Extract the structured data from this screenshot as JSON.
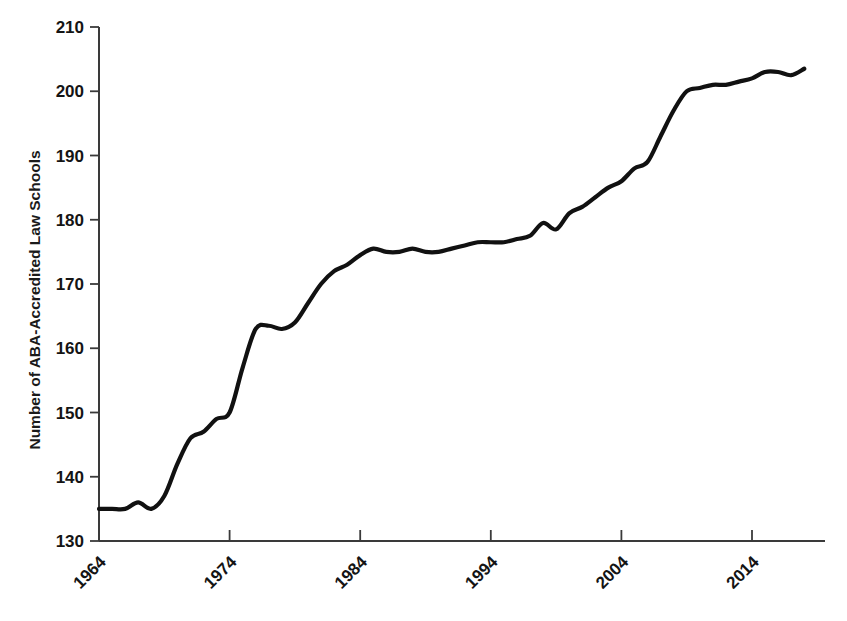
{
  "chart_data": {
    "type": "line",
    "title": "",
    "subtitle": "",
    "xlabel": "",
    "ylabel": "Number of ABA-Accredited Law Schools",
    "xlim": [
      1964,
      2018
    ],
    "ylim": [
      130,
      210
    ],
    "ytick_labels": [
      "210",
      "200",
      "190",
      "180",
      "170",
      "160",
      "150",
      "140",
      "130"
    ],
    "ytick_values": [
      210,
      200,
      190,
      180,
      170,
      160,
      150,
      140,
      130
    ],
    "xtick_labels": [
      "1964",
      "1974",
      "1984",
      "1994",
      "2004",
      "2014"
    ],
    "xtick_values": [
      1964,
      1974,
      1984,
      1994,
      2004,
      2014
    ],
    "xtick_rotation_deg": 45,
    "grid": false,
    "legend": null,
    "legend_position": "none",
    "line_color": "#111111",
    "annotations": [],
    "series": [
      {
        "name": "Number of ABA-Accredited Law Schools",
        "x": [
          1964,
          1965,
          1966,
          1967,
          1968,
          1969,
          1970,
          1971,
          1972,
          1973,
          1974,
          1975,
          1976,
          1977,
          1978,
          1979,
          1980,
          1981,
          1982,
          1983,
          1984,
          1985,
          1986,
          1987,
          1988,
          1989,
          1990,
          1991,
          1992,
          1993,
          1994,
          1995,
          1996,
          1997,
          1998,
          1999,
          2000,
          2001,
          2002,
          2003,
          2004,
          2005,
          2006,
          2007,
          2008,
          2009,
          2010,
          2011,
          2012,
          2013,
          2014,
          2015,
          2016,
          2017,
          2018
        ],
        "values": [
          135,
          135,
          135,
          136,
          135,
          137,
          142,
          146,
          147,
          149,
          150,
          157,
          163,
          163.5,
          163,
          164,
          167,
          170,
          172,
          173,
          174.5,
          175.5,
          175,
          175,
          175.5,
          175,
          175,
          175.5,
          176,
          176.5,
          176.5,
          176.5,
          177,
          177.5,
          179.5,
          178.5,
          181,
          182,
          183.5,
          185,
          186,
          188,
          189,
          193,
          197,
          200,
          200.5,
          201,
          201,
          201.5,
          202,
          203,
          203,
          202.5,
          203.5
        ]
      }
    ]
  },
  "axes": {
    "plot_left_px": 99,
    "plot_right_px": 825,
    "plot_top_px": 27,
    "plot_bottom_px": 541
  }
}
